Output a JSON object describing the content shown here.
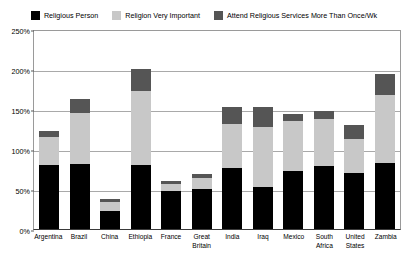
{
  "chart_data": {
    "type": "bar",
    "stacked": true,
    "title": "",
    "subtitle": "",
    "xlabel": "",
    "ylabel": "",
    "ylim": [
      0,
      250
    ],
    "ytick_labels": [
      "0%",
      "50%",
      "100%",
      "150%",
      "200%",
      "250%"
    ],
    "ytick_values": [
      0,
      50,
      100,
      150,
      200,
      250
    ],
    "grid": true,
    "legend_position": "top",
    "categories": [
      "Argentina",
      "Brazil",
      "China",
      "Ethiopia",
      "France",
      "Great Britain",
      "India",
      "Iraq",
      "Mexico",
      "South Africa",
      "United States",
      "Zambia"
    ],
    "series": [
      {
        "name": "Religious Person",
        "color": "#000000",
        "values": [
          80,
          81,
          23,
          80,
          48,
          50,
          76,
          53,
          73,
          79,
          70,
          82
        ]
      },
      {
        "name": "Religion Very Important",
        "color": "#c8c8c8",
        "values": [
          35,
          64,
          11,
          92,
          8,
          14,
          55,
          75,
          62,
          59,
          42,
          85
        ]
      },
      {
        "name": "Attend Religious Services More Than Once/Wk",
        "color": "#555555",
        "values": [
          8,
          17,
          3,
          28,
          4,
          5,
          21,
          25,
          9,
          10,
          18,
          27
        ]
      }
    ],
    "totals": [
      123,
      162,
      37,
      200,
      60,
      69,
      152,
      153,
      144,
      148,
      130,
      194
    ]
  },
  "colors": {
    "plot_background": "#ffffff",
    "gridline": "#a9a9a9",
    "axis": "#3a3a3a",
    "text": "#000000"
  }
}
